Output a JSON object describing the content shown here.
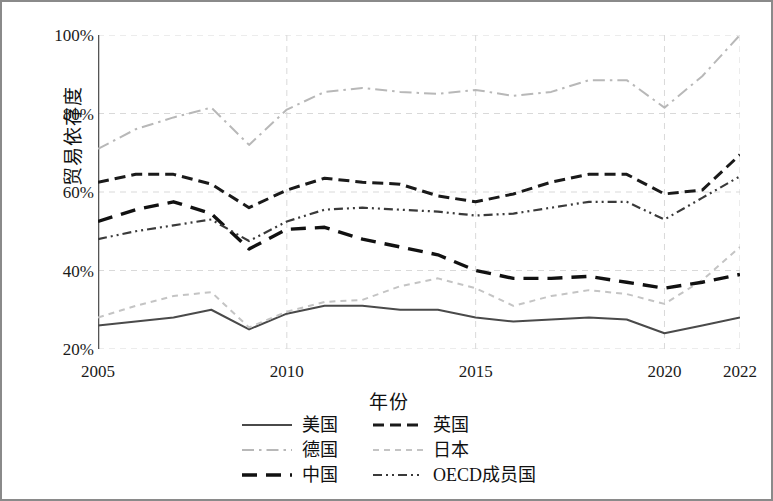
{
  "figure": {
    "border_color": "#8a8a8a",
    "background": "#ffffff"
  },
  "axes": {
    "y_title": "贸易依存度",
    "x_title": "年份",
    "y_ticks": [
      "100%",
      "80%",
      "60%",
      "40%",
      "20%"
    ],
    "y_tick_values": [
      100,
      80,
      60,
      40,
      20
    ],
    "x_ticks": [
      "2005",
      "2010",
      "2015",
      "2020",
      "2022"
    ],
    "x_tick_values": [
      2005,
      2010,
      2015,
      2020,
      2022
    ]
  },
  "legend": {
    "items": [
      {
        "label": "美国",
        "style": "solid",
        "color": "#4a4a4a"
      },
      {
        "label": "英国",
        "style": "dashed",
        "color": "#1a1a1a"
      },
      {
        "label": "德国",
        "style": "dashdot",
        "color": "#b8b8b8"
      },
      {
        "label": "日本",
        "style": "shortdash",
        "color": "#c4c4c4"
      },
      {
        "label": "中国",
        "style": "longdash",
        "color": "#111111"
      },
      {
        "label": "OECD成员国",
        "style": "dashdotdot",
        "color": "#3a3a3a"
      }
    ]
  },
  "chart_data": {
    "type": "line",
    "title": "",
    "xlabel": "年份",
    "ylabel": "贸易依存度",
    "xlim": [
      2005,
      2022
    ],
    "ylim": [
      20,
      100
    ],
    "grid": true,
    "legend_position": "bottom",
    "x": [
      2005,
      2006,
      2007,
      2008,
      2009,
      2010,
      2011,
      2012,
      2013,
      2014,
      2015,
      2016,
      2017,
      2018,
      2019,
      2020,
      2021,
      2022
    ],
    "series": [
      {
        "name": "美国",
        "style": "solid",
        "color": "#4a4a4a",
        "values": [
          26,
          27,
          28,
          30,
          25,
          29,
          31,
          31,
          30,
          30,
          28,
          27,
          27.5,
          28,
          27.5,
          24,
          26,
          28
        ]
      },
      {
        "name": "英国",
        "style": "dashed",
        "color": "#1a1a1a",
        "values": [
          62.5,
          64.5,
          64.5,
          62,
          56,
          60.5,
          63.5,
          62.5,
          62,
          59,
          57.5,
          59.5,
          62.5,
          64.5,
          64.5,
          59.5,
          60.5,
          69.5
        ]
      },
      {
        "name": "德国",
        "style": "dashdot",
        "color": "#b8b8b8",
        "values": [
          71,
          76,
          79,
          81.5,
          72,
          81,
          85.5,
          86.5,
          85.5,
          85,
          86,
          84.5,
          85.5,
          88.5,
          88.5,
          81.5,
          89.5,
          100
        ]
      },
      {
        "name": "日本",
        "style": "shortdash",
        "color": "#c4c4c4",
        "values": [
          28,
          31,
          33.5,
          34.5,
          25.5,
          29.5,
          32,
          32.5,
          36,
          38,
          35.5,
          31,
          33.5,
          35,
          34,
          31.5,
          37.5,
          46
        ]
      },
      {
        "name": "中国",
        "style": "longdash",
        "color": "#111111",
        "values": [
          52.5,
          55.5,
          57.5,
          54.5,
          45.5,
          50.5,
          51,
          48,
          46,
          44,
          40,
          38,
          38,
          38.5,
          37,
          35.5,
          37,
          39
        ]
      },
      {
        "name": "OECD成员国",
        "style": "dashdotdot",
        "color": "#3a3a3a",
        "values": [
          48,
          50,
          51.5,
          53,
          47.5,
          52.5,
          55.5,
          56,
          55.5,
          55,
          54,
          54.5,
          56,
          57.5,
          57.5,
          53,
          58.5,
          64
        ]
      }
    ]
  }
}
